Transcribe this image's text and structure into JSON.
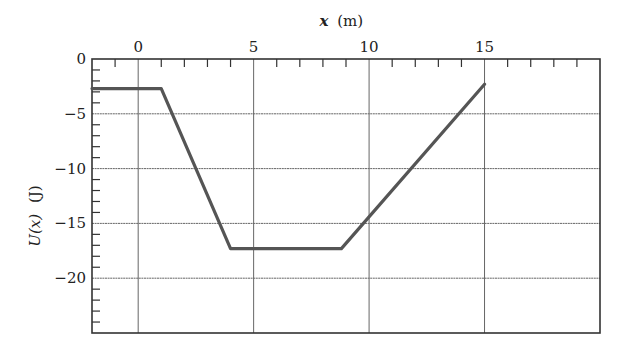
{
  "chart_data": {
    "type": "line",
    "title": "",
    "xlabel": "x (m)",
    "ylabel": "U(x) (J)",
    "xlabel_var": "x",
    "xlabel_unit": "(m)",
    "ylabel_var": "U(x)",
    "ylabel_unit": "(J)",
    "xlim": [
      -2,
      20
    ],
    "ylim": [
      -25,
      0
    ],
    "x_ticks": [
      0,
      5,
      10,
      15
    ],
    "x_tick_labels": [
      "0",
      "5",
      "10",
      "15"
    ],
    "y_ticks": [
      0,
      -5,
      -10,
      -15,
      -20
    ],
    "y_tick_labels": [
      "0",
      "−5",
      "−10",
      "−15",
      "−20"
    ],
    "x_axis_position": "top",
    "grid": true,
    "minor_tick_step_x": 1,
    "minor_tick_step_y": 1,
    "series": [
      {
        "name": "U(x)",
        "color": "#555555",
        "x": [
          -2,
          1,
          4,
          8.8,
          15
        ],
        "y": [
          -2.7,
          -2.7,
          -17.3,
          -17.3,
          -2.3
        ]
      }
    ]
  },
  "colors": {
    "line": "#555555",
    "grid": "#666666",
    "frame": "#333333"
  }
}
